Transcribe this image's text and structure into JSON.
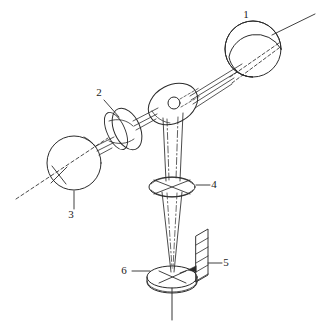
{
  "figure": {
    "type": "technical-line-diagram",
    "background_color": "#ffffff",
    "line_color": "#2b2b2b",
    "width": 322,
    "height": 325
  },
  "callouts": [
    {
      "id": "callout-1",
      "number": "1",
      "target": "upper-right-sphere",
      "text_x": 246,
      "text_y": 18,
      "leader": "from sphere edge up-right"
    },
    {
      "id": "callout-2",
      "number": "2",
      "target": "tilted-lens",
      "text_x": 99,
      "text_y": 96,
      "leader": "diagonal down-right to lens rim"
    },
    {
      "id": "callout-3",
      "number": "3",
      "target": "lower-left-sphere",
      "text_x": 71,
      "text_y": 218,
      "leader": "vertical up to sphere bottom"
    },
    {
      "id": "callout-4",
      "number": "4",
      "target": "objective-lens",
      "text_x": 214,
      "text_y": 188,
      "leader": "horizontal left to lens rim"
    },
    {
      "id": "callout-5",
      "number": "5",
      "target": "hatched-plate",
      "text_x": 226,
      "text_y": 266,
      "leader": "horizontal left to plate"
    },
    {
      "id": "callout-6",
      "number": "6",
      "target": "specimen-stage",
      "text_x": 124,
      "text_y": 274,
      "leader": "horizontal right to stage rim"
    }
  ],
  "components": [
    {
      "id": "upper-right-sphere",
      "name": "sphere-upper-right",
      "cx": 253,
      "cy": 49,
      "r": 28
    },
    {
      "id": "beamsplitter",
      "name": "central-tilted-disc",
      "cx": 173,
      "cy": 104,
      "rx": 26,
      "ry": 18
    },
    {
      "id": "tilted-lens",
      "name": "tilted-lens-element",
      "cx": 124,
      "cy": 127,
      "rx": 16,
      "ry": 22
    },
    {
      "id": "lower-left-sphere",
      "name": "sphere-lower-left",
      "cx": 74,
      "cy": 163,
      "r": 27
    },
    {
      "id": "objective-lens",
      "name": "objective-lens",
      "cx": 172,
      "cy": 187,
      "rx": 22,
      "ry": 10
    },
    {
      "id": "hatched-plate",
      "name": "hatched-plate",
      "x": 196,
      "y": 229,
      "w": 16,
      "h": 53
    },
    {
      "id": "specimen-stage",
      "name": "specimen-stage-disc",
      "cx": 172,
      "cy": 277,
      "rx": 25,
      "ry": 11
    }
  ]
}
